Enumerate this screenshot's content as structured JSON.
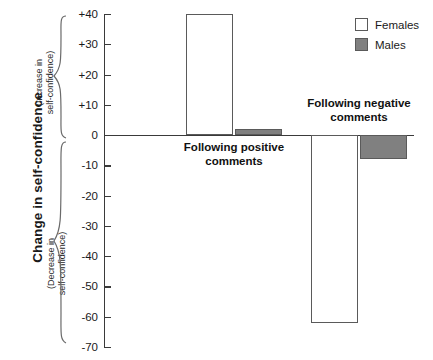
{
  "chart_data": {
    "type": "bar",
    "title": "",
    "xlabel": "",
    "ylabel": "Change in self-confidence",
    "ylim": [
      -70,
      40
    ],
    "ytick_step": 10,
    "grid": false,
    "legend_position": "top-right",
    "categories": [
      "Following positive\ncomments",
      "Following negative\ncomments"
    ],
    "series": [
      {
        "name": "Females",
        "values": [
          40,
          -62
        ],
        "color": "#ffffff",
        "edge_color": "#5a5a5a"
      },
      {
        "name": "Males",
        "values": [
          2,
          -8
        ],
        "color": "#808080",
        "edge_color": "#5a5a5a"
      }
    ],
    "ytick_labels": [
      "+40",
      "+30",
      "+20",
      "+10",
      "0",
      "-10",
      "-20",
      "-30",
      "-40",
      "-50",
      "-60",
      "-70"
    ],
    "ytick_values": [
      40,
      30,
      20,
      10,
      0,
      -10,
      -20,
      -30,
      -40,
      -50,
      -60,
      -70
    ],
    "annotations": {
      "positive_region": "(Increase in self-confidence)",
      "negative_region": "(Decrease in self-confidence)"
    }
  },
  "axis": {
    "title": "Change in self-confidence",
    "increase_note_line1": "(Increase in",
    "increase_note_line2": "self-confidence)",
    "decrease_note_line1": "(Decrease in",
    "decrease_note_line2": "self-confidence)"
  },
  "groups": [
    {
      "label_line1": "Following positive",
      "label_line2": "comments"
    },
    {
      "label_line1": "Following negative",
      "label_line2": "comments"
    }
  ],
  "legend": {
    "items": [
      {
        "label": "Females",
        "swatch": "white-outlined-square"
      },
      {
        "label": "Males",
        "swatch": "gray-filled-square"
      }
    ]
  },
  "colors": {
    "male_fill": "#808080",
    "female_fill": "#ffffff",
    "edge": "#5a5a5a",
    "axis": "#3a3a3a",
    "text": "#1a1a1a"
  }
}
